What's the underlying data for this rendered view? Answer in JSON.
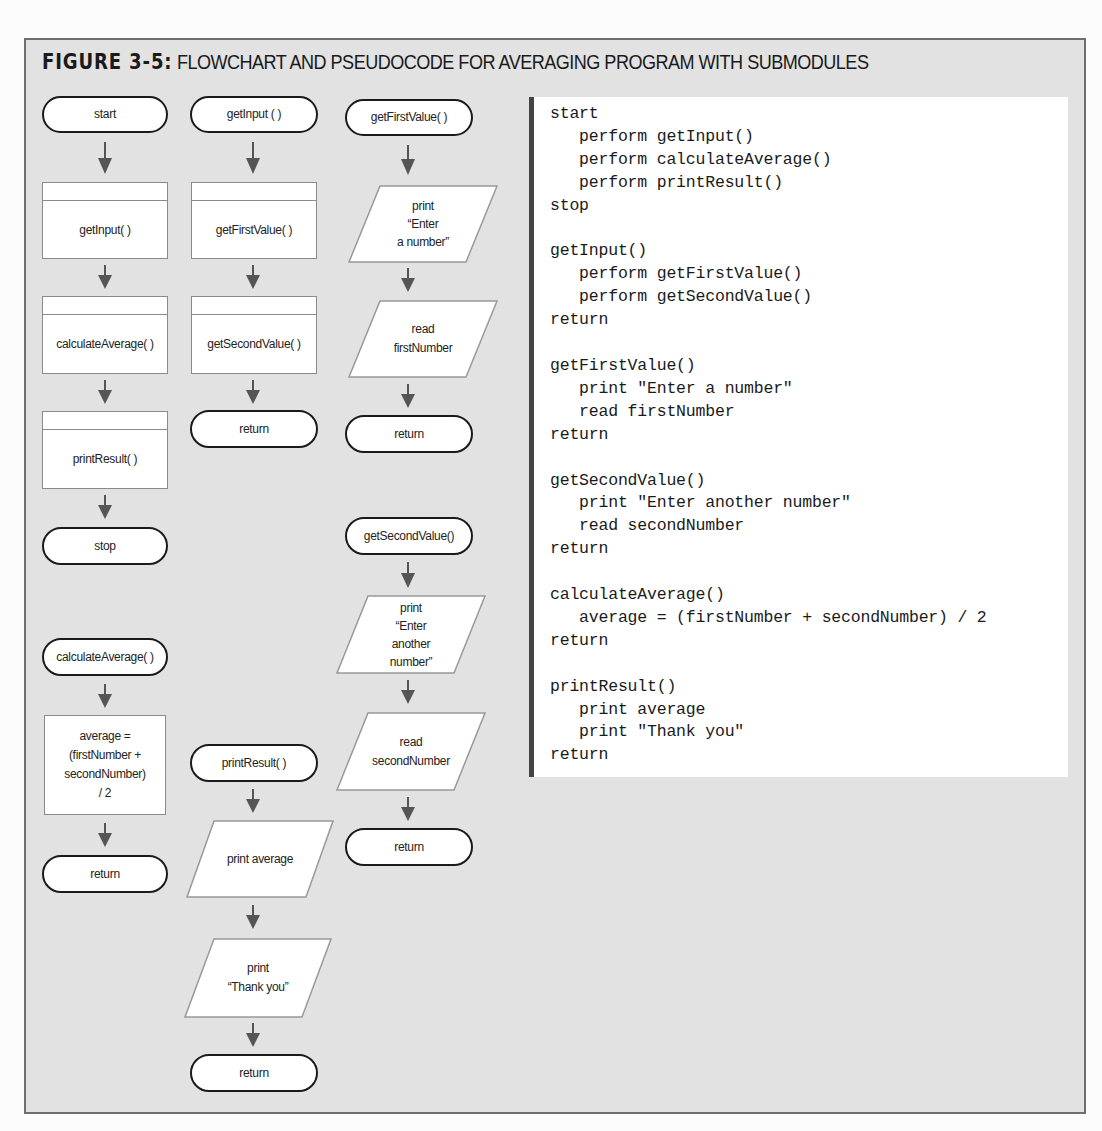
{
  "figure": {
    "label": "FIGURE 3-5:",
    "caption": "FLOWCHART AND PSEUDOCODE FOR AVERAGING PROGRAM WITH SUBMODULES"
  },
  "flowchart": {
    "main": {
      "start": "start",
      "call1": "getInput( )",
      "call2": "calculateAverage( )",
      "call3": "printResult( )",
      "stop": "stop"
    },
    "getInput": {
      "header": "getInput ( )",
      "call1": "getFirstValue( )",
      "call2": "getSecondValue( )",
      "end": "return"
    },
    "getFirstValue": {
      "header": "getFirstValue( )",
      "output": "print\n“Enter\na number”",
      "input": "read\nfirstNumber",
      "end": "return"
    },
    "getSecondValue": {
      "header": "getSecondValue()",
      "output": "print\n“Enter\nanother\nnumber”",
      "input": "read\nsecondNumber",
      "end": "return"
    },
    "calculateAverage": {
      "header": "calculateAverage( )",
      "process": "average =\n(firstNumber +\nsecondNumber)\n/ 2",
      "end": "return"
    },
    "printResult": {
      "header": "printResult( )",
      "output1": "print average",
      "output2": "print\n“Thank you”",
      "end": "return"
    }
  },
  "pseudocode": {
    "lines": [
      "start",
      "   perform getInput()",
      "   perform calculateAverage()",
      "   perform printResult()",
      "stop",
      "",
      "getInput()",
      "   perform getFirstValue()",
      "   perform getSecondValue()",
      "return",
      "",
      "getFirstValue()",
      "   print \"Enter a number\"",
      "   read firstNumber",
      "return",
      "",
      "getSecondValue()",
      "   print \"Enter another number\"",
      "   read secondNumber",
      "return",
      "",
      "calculateAverage()",
      "   average = (firstNumber + secondNumber) / 2",
      "return",
      "",
      "printResult()",
      "   print average",
      "   print \"Thank you\"",
      "return"
    ],
    "text": "start\n   perform getInput()\n   perform calculateAverage()\n   perform printResult()\nstop\n\ngetInput()\n   perform getFirstValue()\n   perform getSecondValue()\nreturn\n\ngetFirstValue()\n   print \"Enter a number\"\n   read firstNumber\nreturn\n\ngetSecondValue()\n   print \"Enter another number\"\n   read secondNumber\nreturn\n\ncalculateAverage()\n   average = (firstNumber + secondNumber) / 2\nreturn\n\nprintResult()\n   print average\n   print \"Thank you\"\nreturn"
  },
  "colors": {
    "panel_bg": "#e2e2e2",
    "frame_border": "#6e6e6e",
    "shape_fill": "#ffffff",
    "terminal_border": "#1a1a1a",
    "process_border": "#8a8a8a",
    "arrow": "#555555",
    "code_bar": "#444444"
  }
}
